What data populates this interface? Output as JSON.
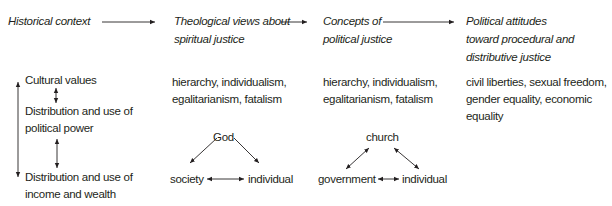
{
  "headers": {
    "historical_context": "Historical context",
    "theological_1": "Theological views about",
    "theological_2": "spiritual justice",
    "concepts_1": "Concepts of",
    "concepts_2": "political justice",
    "political_1": "Political attitudes",
    "political_2": "toward procedural and",
    "political_3": "distributive justice"
  },
  "left_column": {
    "cultural_values": "Cultural values",
    "power_1": "Distribution and use of",
    "power_2": "political power",
    "wealth_1": "Distribution and use of",
    "wealth_2": "income and wealth"
  },
  "theological_values": {
    "line1": "hierarchy, individualism,",
    "line2": "egalitarianism, fatalism"
  },
  "concepts_values": {
    "line1": "hierarchy, individualism,",
    "line2": "egalitarianism, fatalism"
  },
  "political_values": {
    "line1": "civil liberties, sexual freedom,",
    "line2": "gender equality, economic",
    "line3": "equality"
  },
  "triangle_spiritual": {
    "top": "God",
    "left": "society",
    "right": "individual"
  },
  "triangle_political": {
    "top": "church",
    "left": "government",
    "right": "individual"
  }
}
